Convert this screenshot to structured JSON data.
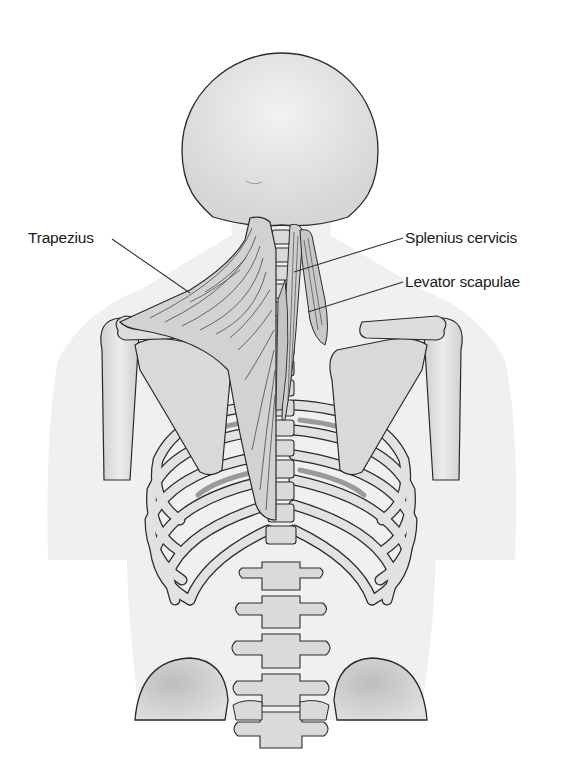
{
  "diagram": {
    "labels": [
      {
        "id": "trapezius",
        "text": "Trapezius",
        "side": "left"
      },
      {
        "id": "splenius-cervicis",
        "text": "Splenius cervicis",
        "side": "right"
      },
      {
        "id": "levator-scapulae",
        "text": "Levator scapulae",
        "side": "right"
      }
    ],
    "colors": {
      "background": "#ffffff",
      "body_silhouette": "#efefef",
      "bone_fill": "#dcdcdc",
      "bone_outline": "#2a2a2a",
      "muscle_fill": "#c8c8c8",
      "muscle_fiber": "#555555",
      "leader_line": "#333333",
      "label_text": "#1a1a1a"
    }
  }
}
